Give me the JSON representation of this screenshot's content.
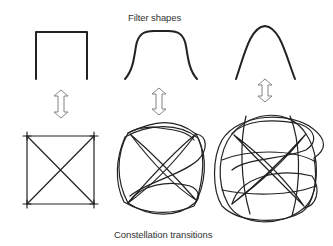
{
  "diagram": {
    "top_label": "Filter shapes",
    "bottom_label": "Constellation transitions",
    "columns": [
      {
        "filter_shape": "rectangular",
        "constellation": "square-with-diagonals"
      },
      {
        "filter_shape": "raised-cosine-flat-top",
        "constellation": "moderate-overshoot-loops"
      },
      {
        "filter_shape": "narrow-bell",
        "constellation": "heavy-overshoot-loops"
      }
    ],
    "connector": "double-headed-arrow",
    "colors": {
      "line": "#222222",
      "arrow_outline": "#777777",
      "text": "#333333",
      "background": "#ffffff"
    }
  }
}
